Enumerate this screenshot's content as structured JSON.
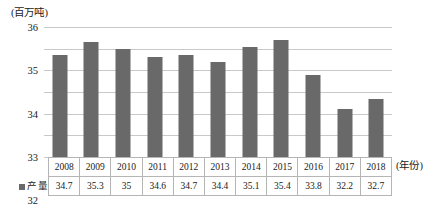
{
  "chart_data": {
    "type": "bar",
    "title": "",
    "subtitle": "",
    "unit_label": "(百万吨)",
    "xlabel": "(年份)",
    "ylabel": "",
    "categories": [
      "2008",
      "2009",
      "2010",
      "2011",
      "2012",
      "2013",
      "2014",
      "2015",
      "2016",
      "2017",
      "2018"
    ],
    "series": [
      {
        "name": "产量",
        "values": [
          34.7,
          35.3,
          35,
          34.6,
          34.7,
          34.4,
          35.1,
          35.4,
          33.8,
          32.2,
          32.7
        ],
        "value_labels": [
          "34.7",
          "35.3",
          "35",
          "34.6",
          "34.7",
          "34.4",
          "35.1",
          "35.4",
          "33.8",
          "32.2",
          "32.7"
        ],
        "color": "#696969"
      }
    ],
    "ylim": [
      30,
      36
    ],
    "yticks": [
      30,
      31,
      32,
      33,
      34,
      35,
      36
    ],
    "ytick_labels": [
      "30",
      "31",
      "32",
      "33",
      "34",
      "35",
      "36"
    ],
    "grid": true,
    "legend_position": "table-row-header"
  },
  "legend": {
    "marker": "square-swatch",
    "label": "产量"
  },
  "table": {
    "year_row_label": "",
    "value_row_label": "产量"
  }
}
